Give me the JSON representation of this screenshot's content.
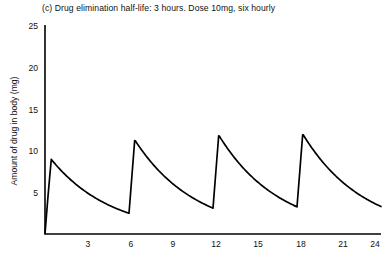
{
  "chart_data": {
    "type": "line",
    "title": "(c) Drug elimination half-life: 3 hours. Dose 10mg, six hourly",
    "xlabel": "",
    "ylabel": "Amount of drug in body (mg)",
    "xlim": [
      0,
      24
    ],
    "ylim": [
      0,
      25
    ],
    "xticks": [
      3,
      6,
      9,
      12,
      15,
      18,
      21,
      24
    ],
    "yticks": [
      5,
      10,
      15,
      20,
      25
    ],
    "grid": false,
    "legend": null,
    "line_color": "#000000",
    "axis_color": "#000000",
    "dose_mg": 10,
    "dose_interval_hours": 6,
    "half_life_hours": 3,
    "dose_times": [
      0,
      6,
      12,
      18
    ],
    "peaks": [
      {
        "time": 0,
        "value": 10.0
      },
      {
        "time": 6,
        "value": 12.5
      },
      {
        "time": 12,
        "value": 12.8
      },
      {
        "time": 18,
        "value": 12.8
      }
    ],
    "troughs": [
      {
        "time": 6,
        "value": 2.5
      },
      {
        "time": 12,
        "value": 2.7
      },
      {
        "time": 18,
        "value": 2.8
      },
      {
        "time": 24,
        "value": 2.8
      }
    ],
    "series": [
      {
        "name": "Amount of drug in body",
        "x": [
          0,
          0.3,
          0.6,
          1,
          1.5,
          2,
          2.5,
          3,
          3.5,
          4,
          4.5,
          5,
          5.5,
          6,
          6,
          6.3,
          6.6,
          7,
          7.5,
          8,
          8.5,
          9,
          9.5,
          10,
          10.5,
          11,
          11.5,
          12,
          12,
          12.3,
          12.6,
          13,
          13.5,
          14,
          14.5,
          15,
          15.5,
          16,
          16.5,
          17,
          17.5,
          18,
          18,
          18.3,
          18.6,
          19,
          19.5,
          20,
          20.5,
          21,
          21.5,
          22,
          22.5,
          23,
          23.5,
          24
        ],
        "y": [
          0,
          9.2,
          10.0,
          9.4,
          8.3,
          7.3,
          6.3,
          5.5,
          4.8,
          4.2,
          3.7,
          3.2,
          2.8,
          2.5,
          12.5,
          12.2,
          11.5,
          10.6,
          9.3,
          8.2,
          7.2,
          6.3,
          5.5,
          4.8,
          4.2,
          3.7,
          3.2,
          2.7,
          12.8,
          12.5,
          11.8,
          10.8,
          9.5,
          8.4,
          7.3,
          6.4,
          5.6,
          4.9,
          4.3,
          3.8,
          3.3,
          2.8,
          12.8,
          12.5,
          11.8,
          10.8,
          9.5,
          8.4,
          7.3,
          6.4,
          5.6,
          4.9,
          4.3,
          3.8,
          3.3,
          2.8
        ]
      }
    ]
  }
}
